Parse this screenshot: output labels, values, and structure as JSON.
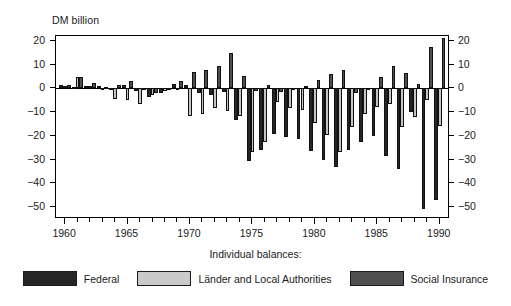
{
  "chart_data": {
    "type": "bar",
    "title": "",
    "ylabel": "DM billion",
    "xlabel": "",
    "ylim": [
      -55,
      22
    ],
    "yticks": [
      20,
      10,
      0,
      -10,
      -20,
      -30,
      -40,
      -50
    ],
    "ytick_labels": [
      "20",
      "10",
      "0",
      "−10",
      "−20",
      "−30",
      "−40",
      "−50"
    ],
    "xticks": [
      1960,
      1965,
      1970,
      1975,
      1980,
      1985,
      1990
    ],
    "xtick_labels": [
      "1960",
      "1965",
      "1970",
      "1975",
      "1980",
      "1985",
      "1990"
    ],
    "grid": false,
    "legend_position": "below",
    "legend_caption": "Individual balances:",
    "x": [
      1960,
      1961,
      1962,
      1963,
      1964,
      1965,
      1966,
      1967,
      1968,
      1969,
      1970,
      1971,
      1972,
      1973,
      1974,
      1975,
      1976,
      1977,
      1978,
      1979,
      1980,
      1981,
      1982,
      1983,
      1984,
      1985,
      1986,
      1987,
      1988,
      1989,
      1990
    ],
    "series": [
      {
        "name": "Federal",
        "color": "#262626",
        "values": [
          1.2,
          0.5,
          1.0,
          1.0,
          0.3,
          1.5,
          -1.0,
          -3.5,
          -1.8,
          2.0,
          1.2,
          -2.0,
          -3.0,
          -1.5,
          -13.5,
          -30.5,
          -25.8,
          -19.3,
          -20.5,
          -21.3,
          -26.5,
          -30.0,
          -33.0,
          -26.0,
          -22.5,
          -20.0,
          -28.5,
          -34.0,
          -10.0,
          -51.0,
          -47.0
        ]
      },
      {
        "name": "Länder and Local Authorities",
        "color": "#c9c9c9",
        "values": [
          0.8,
          4.8,
          0.8,
          -0.3,
          -4.5,
          -4.8,
          -6.5,
          -2.8,
          -1.0,
          0.0,
          -11.5,
          -10.8,
          -8.5,
          -9.5,
          -11.5,
          -27.0,
          -22.5,
          -5.8,
          -8.5,
          -9.0,
          -14.5,
          -19.5,
          -27.0,
          -16.5,
          -10.8,
          -7.8,
          -6.8,
          -16.5,
          -12.0,
          -5.0,
          -16.0
        ]
      },
      {
        "name": "Social Insurance",
        "color": "#4f4f4f",
        "values": [
          1.5,
          4.8,
          2.3,
          0.5,
          1.5,
          3.0,
          -0.5,
          -2.0,
          -0.5,
          3.0,
          7.0,
          7.8,
          9.5,
          15.0,
          5.3,
          -1.0,
          1.2,
          -1.5,
          -0.5,
          0.8,
          3.5,
          6.0,
          7.5,
          -2.0,
          -0.5,
          4.8,
          9.3,
          6.5,
          1.8,
          17.3,
          21.0
        ]
      }
    ]
  },
  "legend": {
    "caption": "Individual balances:",
    "items": [
      {
        "label": "Federal",
        "key": "federal"
      },
      {
        "label": "Länder and Local Authorities",
        "key": "laender"
      },
      {
        "label": "Social Insurance",
        "key": "social"
      }
    ]
  }
}
